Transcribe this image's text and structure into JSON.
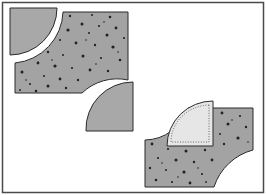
{
  "figure": {
    "colors": {
      "background": "#ffffff",
      "frame": "#4a4a4a",
      "patch_fill": "#a8a8a8",
      "print_fill": "#a3a3a3",
      "outline": "#2b2b2b",
      "light_fill": "#e6e6e6",
      "speckle": "#222222"
    }
  }
}
